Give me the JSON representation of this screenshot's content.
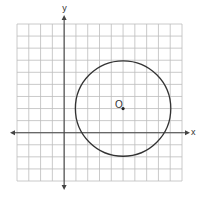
{
  "diagram": {
    "type": "coordinate-plane-circle",
    "axes": {
      "x_label": "x",
      "y_label": "y"
    },
    "grid": {
      "columns": 14,
      "rows": 13,
      "x_min": -4,
      "x_max": 10,
      "y_min": -4,
      "y_max": 9
    },
    "circle": {
      "center_label": "O",
      "center": [
        5,
        2
      ],
      "radius": 4
    },
    "colors": {
      "grid": "#bdbdbd",
      "axis": "#444444",
      "circle": "#333333"
    }
  }
}
